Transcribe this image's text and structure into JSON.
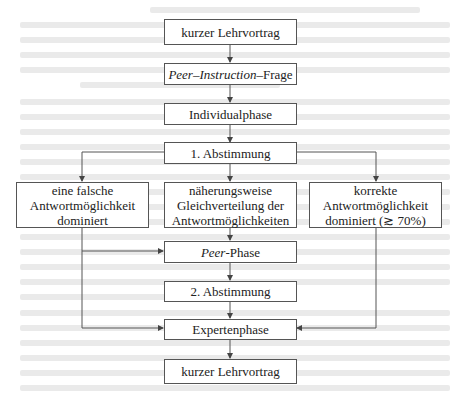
{
  "diagram": {
    "type": "flowchart",
    "nodes": {
      "lehrvortrag_top": {
        "label": "kurzer Lehrvortrag"
      },
      "pi_frage": {
        "label_italic": "Peer–Instruction",
        "label_rest": "–Frage"
      },
      "individualphase": {
        "label": "Individualphase"
      },
      "abstimmung1": {
        "label": "1. Abstimmung"
      },
      "falsch": {
        "line1": "eine falsche",
        "line2": "Antwortmöglichkeit",
        "line3": "dominiert"
      },
      "gleich": {
        "line1": "näherungsweise",
        "line2": "Gleichverteilung der",
        "line3": "Antwortmöglichkeiten"
      },
      "korrekt": {
        "line1": "korrekte",
        "line2": "Antwortmöglichkeit",
        "line3": "dominiert (≳ 70%)"
      },
      "peer_phase": {
        "label_italic": "Peer",
        "label_rest": "-Phase"
      },
      "abstimmung2": {
        "label": "2. Abstimmung"
      },
      "expertenphase": {
        "label": "Expertenphase"
      },
      "lehrvortrag_bottom": {
        "label": "kurzer Lehrvortrag"
      }
    },
    "edges": [
      [
        "kurzer Lehrvortrag",
        "Peer–Instruction–Frage"
      ],
      [
        "Peer–Instruction–Frage",
        "Individualphase"
      ],
      [
        "Individualphase",
        "1. Abstimmung"
      ],
      [
        "1. Abstimmung",
        "eine falsche Antwortmöglichkeit dominiert"
      ],
      [
        "1. Abstimmung",
        "näherungsweise Gleichverteilung der Antwortmöglichkeiten"
      ],
      [
        "1. Abstimmung",
        "korrekte Antwortmöglichkeit dominiert (≳ 70%)"
      ],
      [
        "eine falsche Antwortmöglichkeit dominiert",
        "Peer-Phase"
      ],
      [
        "näherungsweise Gleichverteilung der Antwortmöglichkeiten",
        "Peer-Phase"
      ],
      [
        "eine falsche Antwortmöglichkeit dominiert",
        "Expertenphase"
      ],
      [
        "Peer-Phase",
        "2. Abstimmung"
      ],
      [
        "2. Abstimmung",
        "Expertenphase"
      ],
      [
        "korrekte Antwortmöglichkeit dominiert (≳ 70%)",
        "Expertenphase"
      ],
      [
        "Expertenphase",
        "kurzer Lehrvortrag"
      ]
    ],
    "colors": {
      "stroke": "#555555",
      "text": "#222222",
      "background": "#ffffff"
    }
  }
}
